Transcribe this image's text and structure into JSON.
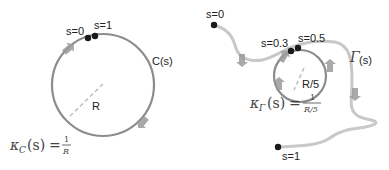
{
  "left_panel": {
    "curve_label": "C(s)",
    "radius_label": "R",
    "start_label": "s=0",
    "end_label": "s=1",
    "curvature": {
      "kappa": "κ",
      "subscript": "C",
      "arg": "(s)",
      "equals": "=",
      "numerator": "1",
      "denominator": "R"
    }
  },
  "right_panel": {
    "curve_label_symbol": "Γ",
    "curve_label_arg": "(s)",
    "radius_label": "R/5",
    "start_label": "s=0",
    "loop_start_label": "s=0.3",
    "loop_end_label": "s=0.5",
    "end_label": "s=1",
    "curvature": {
      "kappa": "κ",
      "subscript": "Γ",
      "arg": "(s)",
      "equals": "=",
      "numerator": "1",
      "denominator": "R/5"
    }
  },
  "colors": {
    "left_curve": "#8c8c8c",
    "right_curve": "#c8c8c8",
    "loop_curve": "#8c8c8c",
    "points": "#1a1a1a",
    "arrows": "#9a9a9a",
    "radius_dash": "#bdbdbd"
  }
}
